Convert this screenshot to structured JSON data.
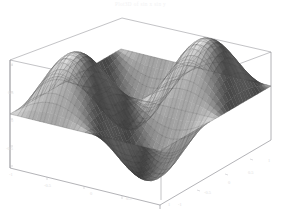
{
  "figure": {
    "title": "Plot3D of sin x sin y",
    "background_color": "#ffffff",
    "surface_color": "#8d8d8d",
    "mesh_color": "#3c3c3c",
    "box_color": "#8a8a90",
    "tick_label_color": "#dedede",
    "width": 281,
    "height": 215
  },
  "chart_data": {
    "type": "surface",
    "title": "Plot3D of sin x sin y",
    "xlabel": "x",
    "ylabel": "y",
    "zlabel": "z",
    "xlim": [
      -1,
      1
    ],
    "ylim": [
      -1,
      1
    ],
    "zlim": [
      -1,
      1
    ],
    "grid": true,
    "legend": false,
    "projection": "3d-wireframe-box",
    "mesh_lines_u": 26,
    "mesh_lines_v": 26,
    "x_ticks": [
      "-0.5",
      "0",
      "0.5",
      "1"
    ],
    "y_ticks": [
      "-1",
      "-0.5",
      "0",
      "0.5"
    ],
    "z_ticks": [
      "-1",
      "-0.5",
      "0",
      "0.5",
      "1"
    ],
    "x": [
      -1,
      -0.8,
      -0.6,
      -0.4,
      -0.2,
      0,
      0.2,
      0.4,
      0.6,
      0.8,
      1
    ],
    "y": [
      -1,
      -0.8,
      -0.6,
      -0.4,
      -0.2,
      0,
      0.2,
      0.4,
      0.6,
      0.8,
      1
    ],
    "z_formula": "sin(pi*x)*sin(pi*y)",
    "z": [
      [
        0.0,
        0.0,
        0.0,
        0.0,
        0.0,
        0.0,
        0.0,
        0.0,
        0.0,
        0.0,
        0.0
      ],
      [
        0.0,
        0.35,
        0.56,
        0.56,
        0.35,
        0.0,
        -0.35,
        -0.56,
        -0.56,
        -0.35,
        0.0
      ],
      [
        0.0,
        0.56,
        0.9,
        0.9,
        0.56,
        0.0,
        -0.56,
        -0.9,
        -0.9,
        -0.56,
        0.0
      ],
      [
        0.0,
        0.56,
        0.9,
        0.9,
        0.56,
        0.0,
        -0.56,
        -0.9,
        -0.9,
        -0.56,
        0.0
      ],
      [
        0.0,
        0.35,
        0.56,
        0.56,
        0.35,
        0.0,
        -0.35,
        -0.56,
        -0.56,
        -0.35,
        0.0
      ],
      [
        0.0,
        0.0,
        0.0,
        0.0,
        0.0,
        0.0,
        0.0,
        0.0,
        0.0,
        0.0,
        0.0
      ],
      [
        0.0,
        -0.35,
        -0.56,
        -0.56,
        -0.35,
        0.0,
        0.35,
        0.56,
        0.56,
        0.35,
        0.0
      ],
      [
        0.0,
        -0.56,
        -0.9,
        -0.9,
        -0.56,
        0.0,
        0.56,
        0.9,
        0.9,
        0.56,
        0.0
      ],
      [
        0.0,
        -0.56,
        -0.9,
        -0.9,
        -0.56,
        0.0,
        0.56,
        0.9,
        0.9,
        0.56,
        0.0
      ],
      [
        0.0,
        -0.35,
        -0.56,
        -0.56,
        -0.35,
        0.0,
        0.35,
        0.56,
        0.56,
        0.35,
        0.0
      ],
      [
        0.0,
        0.0,
        0.0,
        0.0,
        0.0,
        0.0,
        0.0,
        0.0,
        0.0,
        0.0,
        0.0
      ]
    ]
  },
  "axes": {
    "x_tick_labels": [
      {
        "text": "-0.5",
        "left": 44,
        "top": 183
      },
      {
        "text": "0",
        "left": 90,
        "top": 191
      },
      {
        "text": "0.5",
        "left": 126,
        "top": 196
      },
      {
        "text": "1",
        "left": 168,
        "top": 202
      }
    ],
    "y_tick_labels": [
      {
        "text": "-1",
        "left": 178,
        "top": 202
      },
      {
        "text": "-0.5",
        "left": 204,
        "top": 190
      },
      {
        "text": "0",
        "left": 228,
        "top": 180
      },
      {
        "text": "0.5",
        "left": 248,
        "top": 170
      },
      {
        "text": "1",
        "left": 268,
        "top": 158
      }
    ],
    "z_tick_labels": [
      {
        "text": "1",
        "left": 11,
        "top": 62
      },
      {
        "text": "0.5",
        "left": 8,
        "top": 90
      },
      {
        "text": "0",
        "left": 11,
        "top": 118
      },
      {
        "text": "-0.5",
        "left": 6,
        "top": 146
      },
      {
        "text": "-1",
        "left": 9,
        "top": 172
      }
    ]
  }
}
